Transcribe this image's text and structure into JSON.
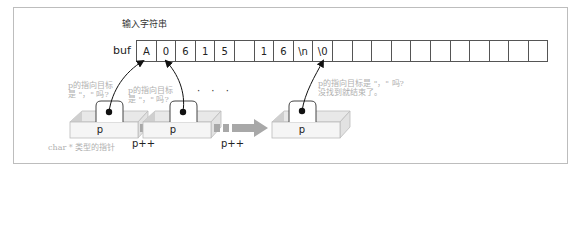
{
  "diagram": {
    "input_label": "输入字符串",
    "buffer_name": "buf",
    "cells": [
      "A",
      "0",
      "6",
      "1",
      "5",
      "",
      "1",
      "6",
      "\\n",
      "\\0",
      "",
      "",
      "",
      "",
      "",
      "",
      "",
      "",
      "",
      "",
      ""
    ],
    "pointer_label": "p",
    "increment_label": "p++",
    "ellipsis": "· · ·",
    "notes": {
      "first_line1": "p的指向目标",
      "first_line2": "是 \"，\" 吗?",
      "second_line1": "p的指向目标",
      "second_line2": "是 \"，\" 吗?",
      "last_line1": "p的指向目标是 \"，\" 吗?",
      "last_line2": "没找到就结束了。",
      "type_caption": "char * 类型的指针"
    },
    "colors": {
      "frame": "#bdbdbd",
      "box_face": "#f3f3f3",
      "box_side": "#d9d9d9",
      "arrow_gray": "#a8a8a8",
      "note_text": "#b0b0b0"
    }
  }
}
